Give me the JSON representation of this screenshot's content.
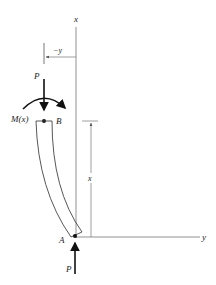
{
  "figure": {
    "type": "column-buckling-free-body",
    "labels": {
      "x_axis_top": "x",
      "y_axis_right": "y",
      "neg_y_dim": "−y",
      "load_top": "P",
      "moment": "M(x)",
      "point_b": "B",
      "point_a": "A",
      "x_dim": "x",
      "load_bottom": "P"
    },
    "colors": {
      "line": "#444444",
      "thin_line": "#777777",
      "ink": "#111111",
      "background": "#ffffff"
    }
  }
}
